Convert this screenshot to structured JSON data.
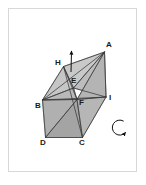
{
  "figure": {
    "kind": "polyhedron-net-diagram",
    "title": "",
    "frame": {
      "border_color": "#d8d8d8",
      "background_color": "#ffffff",
      "x": 8,
      "y": 8,
      "width": 129,
      "height": 164
    },
    "palette": {
      "face_light": "#cfcfcf",
      "face_mid": "#bdbdbd",
      "face_dark": "#a9a9a9",
      "face_darker": "#9a9a9a",
      "edge": "#3a3a3a",
      "label": "#1a1a1a",
      "arrow": "#111111"
    },
    "vertices": [
      {
        "id": "A",
        "label": "A",
        "x": 104.5,
        "y": 52.0,
        "label_x": 106,
        "label_y": 41
      },
      {
        "id": "B",
        "label": "B",
        "x": 42.5,
        "y": 100.0,
        "label_x": 35,
        "label_y": 102
      },
      {
        "id": "C",
        "label": "C",
        "x": 82.5,
        "y": 137.5,
        "label_x": 79,
        "label_y": 139
      },
      {
        "id": "D",
        "label": "D",
        "x": 45.5,
        "y": 137.5,
        "label_x": 40,
        "label_y": 139
      },
      {
        "id": "E",
        "label": "E",
        "x": 73.5,
        "y": 88.0,
        "label_x": 71,
        "label_y": 77
      },
      {
        "id": "F",
        "label": "F",
        "x": 77.0,
        "y": 99.5,
        "label_x": 79,
        "label_y": 99
      },
      {
        "id": "H",
        "label": "H",
        "x": 63.5,
        "y": 66.5,
        "label_x": 55,
        "label_y": 59
      },
      {
        "id": "I",
        "label": "I",
        "x": 106.0,
        "y": 97.0,
        "label_x": 109,
        "label_y": 94
      }
    ],
    "faces": [
      {
        "name": "face-B-H-E",
        "points": "42.5,100 63.5,66.5 73.5,88",
        "fill": "#c6c6c6"
      },
      {
        "name": "face-H-E-A",
        "points": "63.5,66.5 73.5,88 104.5,52",
        "fill": "#c9c9c9"
      },
      {
        "name": "face-E-A-I",
        "points": "73.5,88 104.5,52 106,97",
        "fill": "#bdbdbd"
      },
      {
        "name": "face-F-I-A",
        "points": "77,99.5 106,97 104.5,52",
        "fill": "#b4b4b4"
      },
      {
        "name": "face-B-E-F",
        "points": "42.5,100 73.5,88 77,99.5",
        "fill": "#b9b9b9"
      },
      {
        "name": "face-B-F-D",
        "points": "42.5,100 77,99.5 45.5,137.5",
        "fill": "#b0b0b0"
      },
      {
        "name": "face-D-F-C",
        "points": "45.5,137.5 77,99.5 82.5,137.5",
        "fill": "#a4a4a4"
      },
      {
        "name": "face-F-C-I",
        "points": "77,99.5 82.5,137.5 106,97",
        "fill": "#b6b6b6"
      }
    ],
    "edges": [
      {
        "name": "edge-B-H",
        "from": "B",
        "to": "H"
      },
      {
        "name": "edge-H-A",
        "from": "H",
        "to": "A"
      },
      {
        "name": "edge-A-I",
        "from": "A",
        "to": "I"
      },
      {
        "name": "edge-I-B",
        "from": "I",
        "to": "B"
      },
      {
        "name": "edge-B-D",
        "from": "B",
        "to": "D"
      },
      {
        "name": "edge-D-C",
        "from": "D",
        "to": "C"
      },
      {
        "name": "edge-C-I",
        "from": "C",
        "to": "I"
      },
      {
        "name": "edge-H-E",
        "from": "H",
        "to": "E"
      },
      {
        "name": "edge-H-F",
        "from": "H",
        "to": "F"
      },
      {
        "name": "edge-E-A",
        "from": "E",
        "to": "A"
      },
      {
        "name": "edge-E-B",
        "from": "E",
        "to": "B"
      },
      {
        "name": "edge-E-I",
        "from": "E",
        "to": "I"
      },
      {
        "name": "edge-E-F",
        "from": "E",
        "to": "F"
      },
      {
        "name": "edge-F-A",
        "from": "F",
        "to": "A"
      },
      {
        "name": "edge-F-B",
        "from": "F",
        "to": "B"
      },
      {
        "name": "edge-F-D",
        "from": "F",
        "to": "D"
      },
      {
        "name": "edge-F-C",
        "from": "F",
        "to": "C"
      },
      {
        "name": "edge-F-I",
        "from": "F",
        "to": "I"
      },
      {
        "name": "edge-H-C",
        "from": "H",
        "to": "C"
      },
      {
        "name": "edge-A-B",
        "from": "A",
        "to": "B"
      }
    ],
    "annotations": {
      "up_arrow": {
        "name": "axis-up-arrow",
        "x1": 71.0,
        "y1": 72.0,
        "x2": 71.5,
        "y2": 51.0
      },
      "rotation_arrow": {
        "name": "rotation-arrow",
        "cx": 119.0,
        "cy": 127.0,
        "r": 7.5
      }
    }
  }
}
